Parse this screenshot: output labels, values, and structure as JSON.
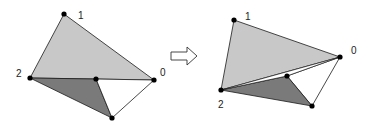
{
  "colors": {
    "light_fill": "#c8c8c8",
    "dark_fill": "#7a7a7a",
    "white_fill": "#ffffff",
    "stroke": "#1a1a1a",
    "vertex": "#000000"
  },
  "before": {
    "labels": {
      "v0": "0",
      "v1": "1",
      "v2": "2"
    }
  },
  "arrow": {
    "icon": "hollow-right-arrow-icon"
  },
  "after": {
    "labels": {
      "v0": "0",
      "v1": "1",
      "v2": "2"
    }
  }
}
